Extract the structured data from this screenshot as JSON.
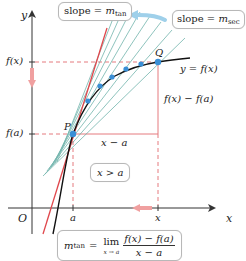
{
  "diagram": {
    "axes": {
      "x_label": "x",
      "y_label": "y",
      "origin_label": "O"
    },
    "points": {
      "P": {
        "label": "P",
        "x_label": "a",
        "y_label": "f(a)"
      },
      "Q": {
        "label": "Q",
        "x_label": "x",
        "y_label": "f(x)"
      }
    },
    "curve_label": "y = f(x)",
    "rise_label": "f(x) − f(a)",
    "run_label": "x − a",
    "condition_label": "x > a",
    "slope_tan": {
      "prefix": "slope = ",
      "m": "m",
      "sub": "tan"
    },
    "slope_sec": {
      "prefix": "slope = ",
      "m": "m",
      "sub": "sec"
    },
    "limit_formula": {
      "m": "m",
      "sub": "tan",
      "equals": "=",
      "lim": "lim",
      "lim_under": "x → a",
      "numerator": "f(x) − f(a)",
      "denominator": "x − a"
    },
    "colors": {
      "tangent_line": "#e0474c",
      "secant_lines": "#5aa8a0",
      "curve": "#111111",
      "points": "#3a8fd6",
      "dashed_guides": "#e57b7f",
      "arrow_blue": "#9fd0ea",
      "arrow_red": "#f0a0a0",
      "axis": "#333333"
    }
  }
}
